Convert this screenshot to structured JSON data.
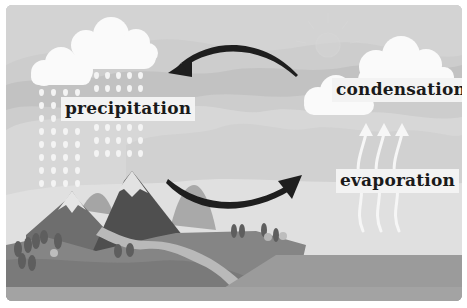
{
  "diagram": {
    "colors": {
      "sky_back": "#cfcfcf",
      "sky_mid": "#c4c4c4",
      "haze": "#dcdcdc",
      "cloud": "#fafafa",
      "mountain_dark": "#5a5a5a",
      "mountain_mid": "#7a7a7a",
      "hill_far": "#a8a8a8",
      "land": "#8c8c8c",
      "river": "#b8b8b8",
      "water": "#9a9a9a",
      "arrow": "#1e1e1e",
      "label_bg": "#f3f3f3",
      "label_text": "#1a1a1a"
    },
    "labels": {
      "precipitation": "precipitation",
      "condensation": "condensation",
      "evaporation": "evaporation"
    },
    "nodes": [
      {
        "id": "precipitation",
        "label": "precipitation",
        "icon": "rain-cloud-icon"
      },
      {
        "id": "condensation",
        "label": "condensation",
        "icon": "cloud-icon"
      },
      {
        "id": "evaporation",
        "label": "evaporation",
        "icon": "rising-vapor-arrows-icon"
      }
    ],
    "edges": [
      {
        "from": "condensation",
        "to": "precipitation",
        "icon": "curved-arrow-left-icon"
      },
      {
        "from": "precipitation",
        "to": "evaporation",
        "icon": "curved-arrow-right-icon"
      }
    ],
    "scene_elements": [
      "sun-icon",
      "mountains",
      "trees",
      "river",
      "lake"
    ]
  }
}
